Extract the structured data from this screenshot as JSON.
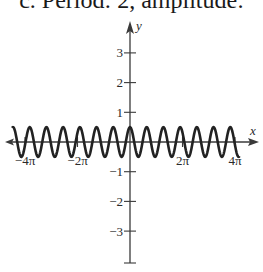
{
  "caption": "c. Period: 2, amplitude:",
  "colors": {
    "axis": "#3a3a3a",
    "curve": "#222222",
    "text": "#2a2a2a"
  },
  "chart_data": {
    "type": "line",
    "title": "",
    "function": "y = 0.5 cos(pi x)",
    "period": 2,
    "amplitude": 0.5,
    "xlabel": "x",
    "ylabel": "y",
    "xlim": [
      -14.5,
      15.3
    ],
    "ylim": [
      -4.0,
      4.0
    ],
    "x_ticks": [
      {
        "value": -12.566,
        "label": "−4π"
      },
      {
        "value": -6.283,
        "label": "−2π"
      },
      {
        "value": 6.283,
        "label": "2π"
      },
      {
        "value": 12.566,
        "label": "4π"
      }
    ],
    "y_ticks": [
      {
        "value": 3,
        "label": "3"
      },
      {
        "value": 2,
        "label": "2"
      },
      {
        "value": 1,
        "label": "1"
      },
      {
        "value": -1,
        "label": "−1"
      },
      {
        "value": -2,
        "label": "−2"
      },
      {
        "value": -3,
        "label": "−3"
      }
    ],
    "curve_domain": [
      -14.1,
      13.1
    ],
    "grid": false,
    "legend": null
  }
}
